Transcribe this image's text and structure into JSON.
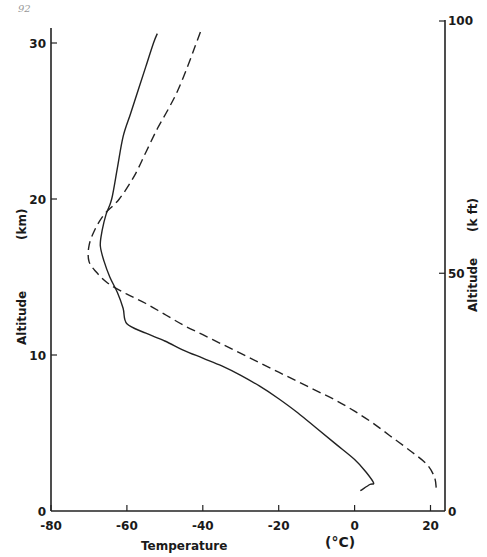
{
  "page_number": "92",
  "chart_data": {
    "type": "line",
    "title": "",
    "xlabel": "Temperature",
    "xunit": "(°C)",
    "ylabel": "Altitude",
    "yunit": "(km)",
    "y2label": "Altitude",
    "y2unit": "(k ft)",
    "xlim": [
      -80,
      24
    ],
    "ylim": [
      0,
      31
    ],
    "y2lim": [
      0,
      101.7
    ],
    "grid": false,
    "legend": null,
    "x_ticks": [
      -80,
      -60,
      -40,
      -20,
      0,
      20
    ],
    "x_tick_labels": [
      "-80",
      "-60",
      "-40",
      "-20",
      "0",
      "20"
    ],
    "y_ticks": [
      0,
      10,
      20,
      30
    ],
    "y_tick_labels": [
      "0",
      "10",
      "20",
      "30"
    ],
    "y2_ticks": [
      0,
      50,
      100
    ],
    "y2_tick_labels": [
      "0",
      "50",
      "100"
    ],
    "series": [
      {
        "name": "solid profile",
        "style": "solid",
        "points": [
          [
            1.5,
            1.3
          ],
          [
            4,
            1.7
          ],
          [
            5,
            1.8
          ],
          [
            3,
            2.5
          ],
          [
            0,
            3.3
          ],
          [
            -5,
            4.3
          ],
          [
            -10,
            5.3
          ],
          [
            -15,
            6.3
          ],
          [
            -20,
            7.2
          ],
          [
            -25,
            8.0
          ],
          [
            -30,
            8.7
          ],
          [
            -35,
            9.3
          ],
          [
            -40,
            9.8
          ],
          [
            -45,
            10.3
          ],
          [
            -50,
            10.9
          ],
          [
            -55,
            11.4
          ],
          [
            -60,
            12.0
          ],
          [
            -61,
            13.0
          ],
          [
            -62.5,
            14.0
          ],
          [
            -64.5,
            15.0
          ],
          [
            -66,
            16.0
          ],
          [
            -67,
            17.0
          ],
          [
            -66.5,
            18.0
          ],
          [
            -65.5,
            19.0
          ],
          [
            -64,
            20.0
          ],
          [
            -62.5,
            22.0
          ],
          [
            -61,
            24.0
          ],
          [
            -59,
            25.5
          ],
          [
            -57,
            27.0
          ],
          [
            -55,
            28.5
          ],
          [
            -53,
            30.0
          ],
          [
            -52,
            30.6
          ]
        ]
      },
      {
        "name": "dashed profile",
        "style": "dashed",
        "points": [
          [
            21.5,
            1.5
          ],
          [
            21,
            2.2
          ],
          [
            19,
            3.0
          ],
          [
            15,
            3.8
          ],
          [
            10,
            4.7
          ],
          [
            5,
            5.6
          ],
          [
            0,
            6.4
          ],
          [
            -5,
            7.1
          ],
          [
            -10,
            7.7
          ],
          [
            -15,
            8.3
          ],
          [
            -20,
            8.9
          ],
          [
            -25,
            9.5
          ],
          [
            -30,
            10.1
          ],
          [
            -35,
            10.7
          ],
          [
            -40,
            11.3
          ],
          [
            -45,
            11.9
          ],
          [
            -50,
            12.6
          ],
          [
            -55,
            13.3
          ],
          [
            -60,
            13.9
          ],
          [
            -65,
            14.6
          ],
          [
            -68,
            15.3
          ],
          [
            -70,
            16.0
          ],
          [
            -70,
            17.0
          ],
          [
            -68.5,
            18.0
          ],
          [
            -66,
            19.0
          ],
          [
            -62,
            20.0
          ],
          [
            -58,
            21.5
          ],
          [
            -55,
            23.0
          ],
          [
            -52,
            24.5
          ],
          [
            -49,
            25.8
          ],
          [
            -46.5,
            27.0
          ],
          [
            -44,
            28.5
          ],
          [
            -42,
            29.8
          ],
          [
            -40.5,
            30.8
          ]
        ]
      }
    ]
  }
}
